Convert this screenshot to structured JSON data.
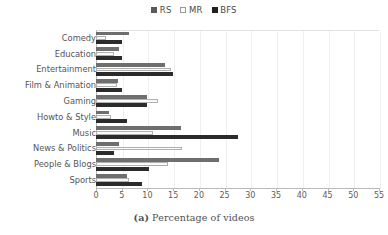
{
  "chart_data": {
    "type": "bar",
    "orientation": "horizontal",
    "title": "",
    "caption_prefix": "(a)",
    "caption_text": "Percentage of videos",
    "xlabel": "",
    "ylabel": "",
    "xlim": [
      0,
      55
    ],
    "xticks": [
      0,
      5,
      10,
      15,
      20,
      25,
      30,
      35,
      40,
      45,
      50,
      55
    ],
    "grid": true,
    "legend_position": "top-center",
    "categories": [
      "Comedy",
      "Education",
      "Entertainment",
      "Film & Animation",
      "Gaming",
      "Howto & Style",
      "Music",
      "News & Politics",
      "People & Blogs",
      "Sports"
    ],
    "series": [
      {
        "name": "RS",
        "color": "#6e6e6e",
        "values": [
          6.5,
          4.5,
          13.5,
          4.3,
          10.0,
          2.5,
          16.5,
          4.5,
          24.0,
          6.0
        ]
      },
      {
        "name": "MR",
        "color": "#fafafa",
        "values": [
          2.0,
          3.5,
          14.5,
          4.0,
          12.0,
          3.0,
          11.0,
          16.8,
          14.0,
          6.5
        ]
      },
      {
        "name": "BFS",
        "color": "#2b2b2b",
        "values": [
          5.0,
          5.0,
          15.0,
          5.0,
          10.0,
          6.0,
          27.5,
          3.5,
          10.3,
          9.0
        ]
      }
    ]
  },
  "legend": {
    "items": [
      {
        "label": "RS"
      },
      {
        "label": "MR"
      },
      {
        "label": "BFS"
      }
    ]
  }
}
